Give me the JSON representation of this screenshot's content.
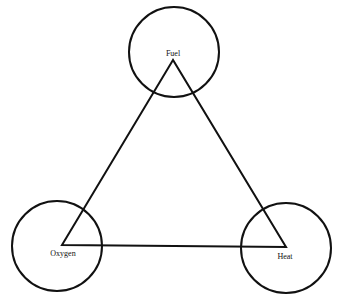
{
  "diagram": {
    "stroke_color": "#111111",
    "nodes": [
      {
        "id": "fuel",
        "label": "Fuel",
        "cx": 174,
        "cy": 52,
        "r": 45,
        "vx": 173,
        "vy": 60,
        "lx": 173,
        "ly": 56
      },
      {
        "id": "oxygen",
        "label": "Oxygen",
        "cx": 57,
        "cy": 246,
        "r": 45,
        "vx": 62,
        "vy": 245,
        "lx": 63,
        "ly": 256
      },
      {
        "id": "heat",
        "label": "Heat",
        "cx": 286,
        "cy": 248,
        "r": 45,
        "vx": 286,
        "vy": 247,
        "lx": 285,
        "ly": 259
      }
    ],
    "edges": [
      [
        "fuel",
        "oxygen"
      ],
      [
        "oxygen",
        "heat"
      ],
      [
        "heat",
        "fuel"
      ]
    ]
  }
}
